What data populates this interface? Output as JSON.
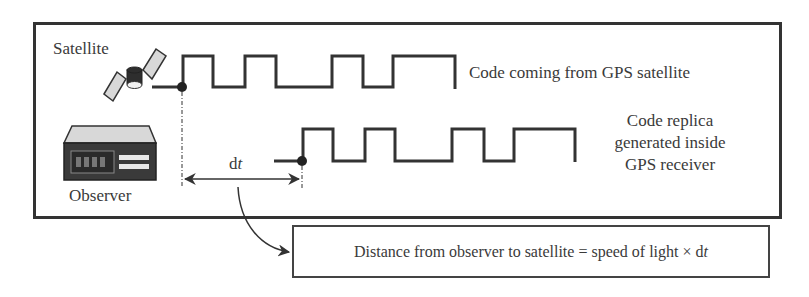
{
  "labels": {
    "satellite": "Satellite",
    "observer": "Observer",
    "incoming_code": "Code coming from GPS satellite",
    "replica_line1": "Code replica",
    "replica_line2": "generated inside",
    "replica_line3": "GPS receiver",
    "dt_d": "d",
    "dt_t": "t"
  },
  "result": {
    "text": "Distance from observer to satellite = speed of light × d",
    "var": "t"
  },
  "colors": {
    "line": "#333333",
    "panel_fill": "#d8d8d8",
    "device_dark": "#3a3a3a",
    "text": "#3a3a3a"
  },
  "waveforms": {
    "incoming": {
      "start_x": 152,
      "dot_x": 182,
      "low_y": 87,
      "high_y": 56,
      "transitions": [
        183,
        213,
        245,
        276,
        332,
        363,
        393,
        455
      ]
    },
    "replica": {
      "start_x": 274,
      "dot_x": 301,
      "low_y": 161,
      "high_y": 129,
      "transitions": [
        303,
        333,
        365,
        395,
        452,
        484,
        514,
        575
      ]
    }
  },
  "time_offset": {
    "from_x": 182,
    "to_x": 302,
    "y": 179
  }
}
